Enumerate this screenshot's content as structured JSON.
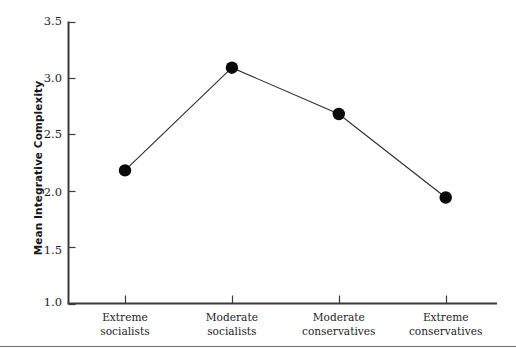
{
  "chart_data": {
    "type": "line",
    "title": "",
    "xlabel": "",
    "ylabel": "Mean Integrative Complexity",
    "categories": [
      "Extreme socialists",
      "Moderate socialists",
      "Moderate conservatives",
      "Extreme conservatives"
    ],
    "category_lines": [
      [
        "Extreme",
        "socialists"
      ],
      [
        "Moderate",
        "socialists"
      ],
      [
        "Moderate",
        "conservatives"
      ],
      [
        "Extreme",
        "conservatives"
      ]
    ],
    "values": [
      2.18,
      3.09,
      2.68,
      1.94
    ],
    "ylim": [
      1.0,
      3.5
    ],
    "yticks": [
      3.5,
      3.0,
      2.5,
      2.0,
      1.5,
      1.0
    ],
    "ytick_labels": [
      "3.5",
      "3.0",
      "2.5",
      "2.0",
      "1.5",
      "1.0"
    ],
    "grid": false,
    "legend": null,
    "marker": "filled-circle",
    "series": [
      {
        "name": "Mean Integrative Complexity",
        "values": [
          2.18,
          3.09,
          2.68,
          1.94
        ]
      }
    ],
    "colors": {
      "line": "#2b2b2e",
      "marker": "#0a0a0a",
      "axis": "#3a3a3d",
      "text": "#1d1d1f",
      "rule": "#6d6d72",
      "background": "#ffffff"
    }
  }
}
